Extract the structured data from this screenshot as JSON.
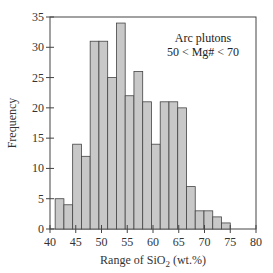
{
  "chart_data": {
    "type": "bar",
    "title": "",
    "annotation": [
      "Arc plutons",
      "50 < Mg# < 70"
    ],
    "xlabel": "Range of SiO2 (wt.%)",
    "xlabel_parts": {
      "pre": "Range of SiO",
      "sub": "2",
      "post": " (wt.%)"
    },
    "ylabel": "Frequency",
    "xlim": [
      40,
      80
    ],
    "ylim": [
      0,
      35
    ],
    "xticks": [
      40,
      45,
      50,
      55,
      60,
      65,
      70,
      75,
      80
    ],
    "yticks": [
      0,
      5,
      10,
      15,
      20,
      25,
      30,
      35
    ],
    "grid": false,
    "legend": "none",
    "bin_start": 41.0,
    "bin_width": 1.7,
    "bin_edges": [
      41.0,
      42.7,
      44.4,
      46.1,
      47.8,
      49.5,
      51.2,
      52.9,
      54.6,
      56.3,
      58.0,
      59.7,
      61.4,
      63.1,
      64.8,
      66.5,
      68.2,
      69.9,
      71.6,
      73.3,
      75.0
    ],
    "values": [
      5,
      4,
      14,
      12,
      31,
      31,
      25,
      34,
      22,
      26,
      21,
      14,
      21,
      21,
      20,
      7,
      3,
      3,
      2,
      1
    ],
    "bar_color": "#c8c8c8",
    "edge_color": "#444444"
  }
}
